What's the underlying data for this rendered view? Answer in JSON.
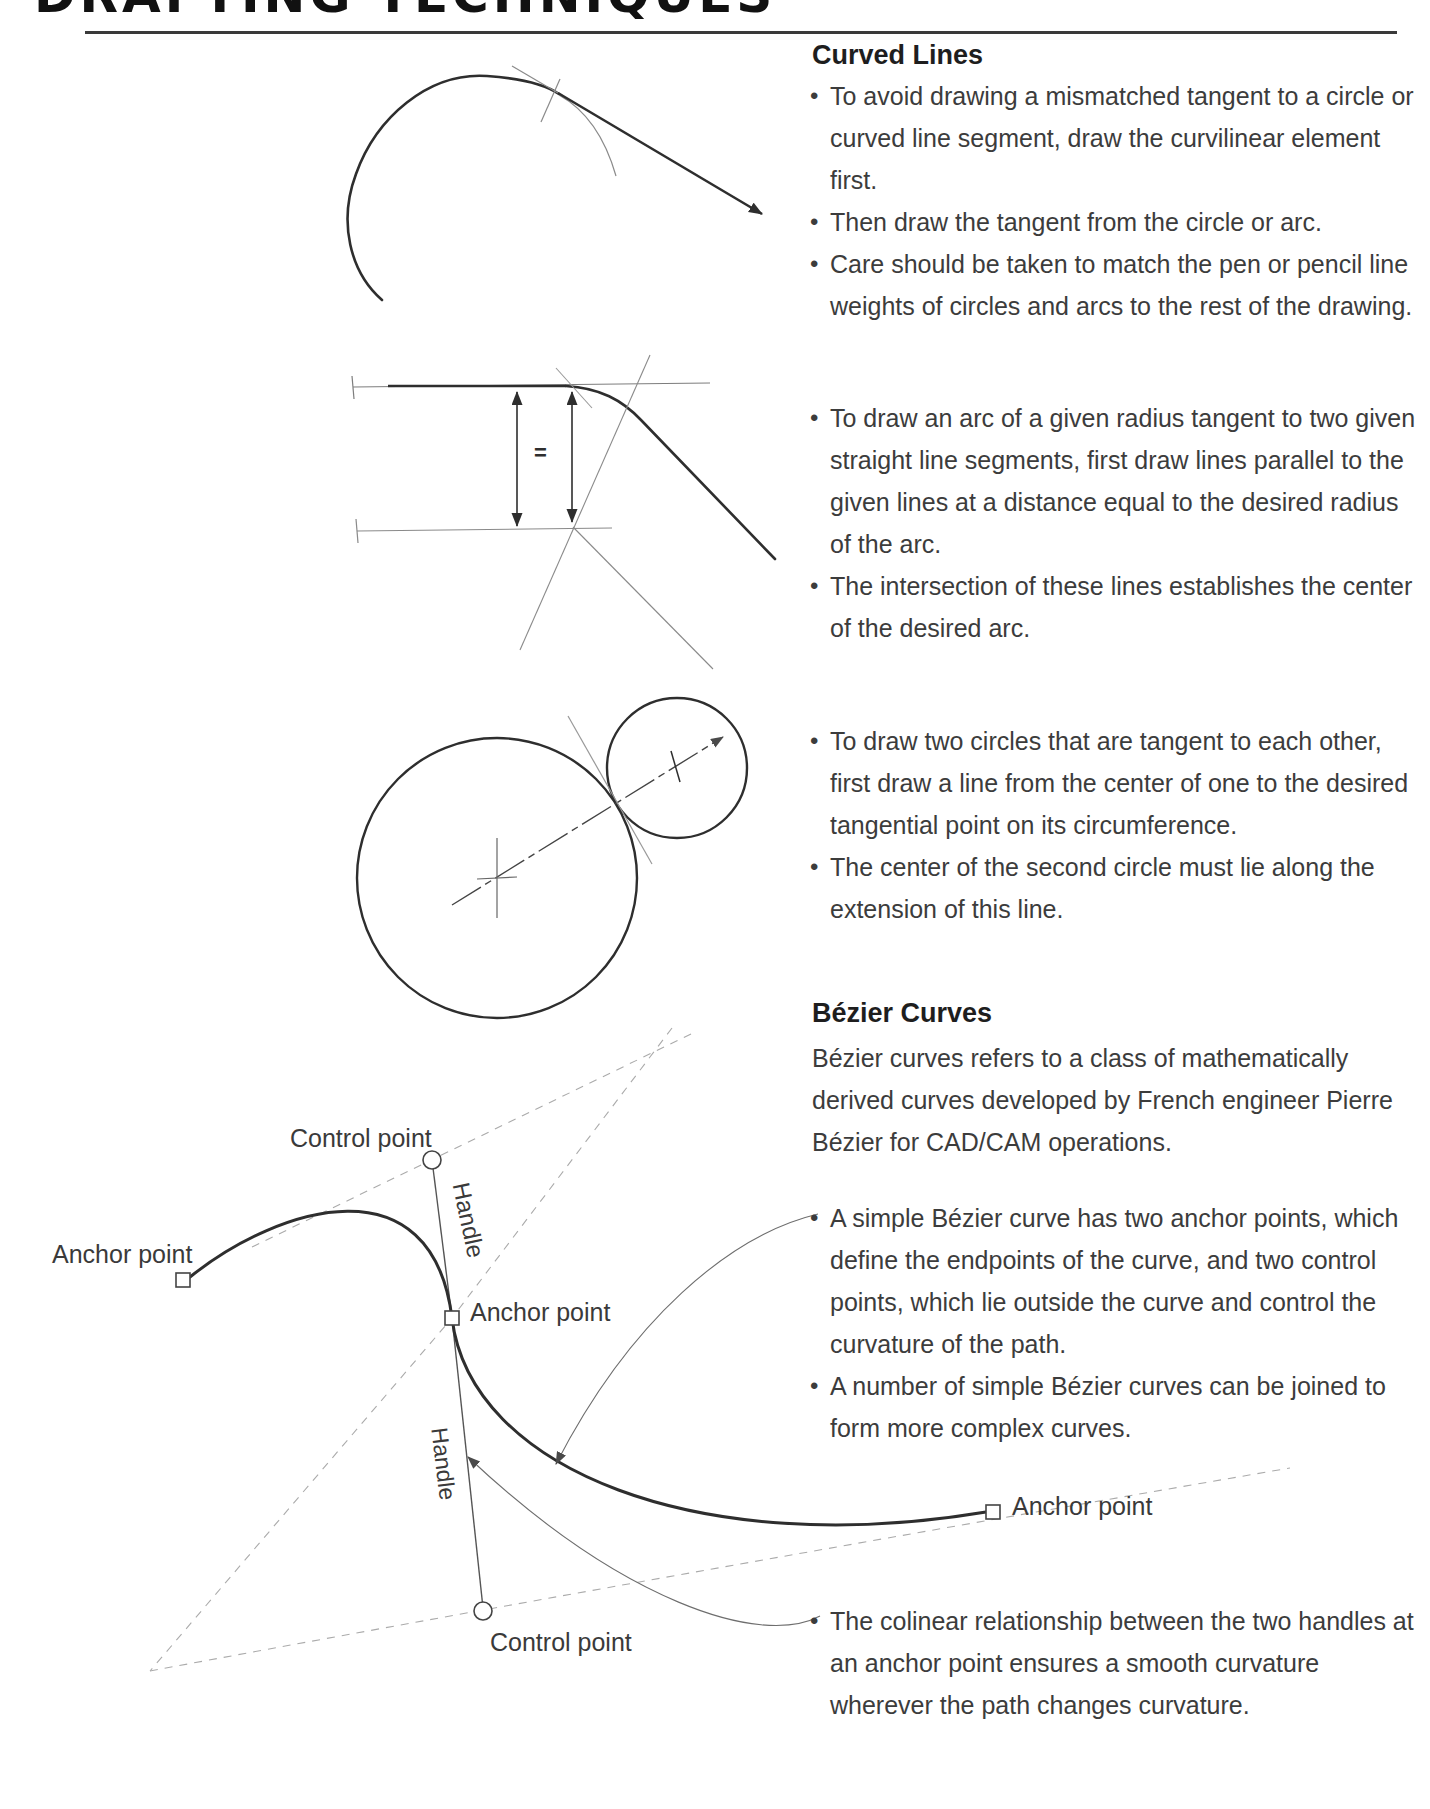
{
  "header": {
    "title": "DRAFTING TECHNIQUES"
  },
  "sections": {
    "curved_lines": {
      "heading": "Curved Lines",
      "bullets": [
        "To avoid drawing a mismatched tangent to a circle or curved line segment, draw the curvilinear element first.",
        "Then draw the tangent from the circle or arc.",
        "Care should be taken to match the pen or pencil line weights of circles and arcs to the rest of the drawing."
      ]
    },
    "arc_tangent": {
      "bullets": [
        "To draw an arc of a given radius tangent to two given straight line segments, first draw lines parallel to the given lines at a distance equal to the desired radius of the arc.",
        "The intersection of these lines establishes the center of the desired arc."
      ]
    },
    "tangent_circles": {
      "bullets": [
        "To draw two circles that are tangent to each other, first draw a line from the center of one to the desired tangential point on its circumference.",
        "The center of the second circle must lie along the extension of this line."
      ]
    },
    "bezier": {
      "heading": "Bézier Curves",
      "intro": "Bézier curves refers to a class of mathematically derived curves developed by French engineer Pierre Bézier for CAD/CAM operations.",
      "bullets": [
        "A simple Bézier curve has two anchor points, which define the endpoints of the curve, and two control points, which lie outside the curve and control the curvature of the path.",
        "A number of simple Bézier curves can be joined to form more complex curves."
      ],
      "note_bullets": [
        "The colinear relationship between the two handles at an anchor point ensures a smooth curvature wherever the path changes curvature."
      ]
    }
  },
  "diagram_labels": {
    "anchor_point": "Anchor point",
    "control_point": "Control point",
    "handle": "Handle",
    "equals": "="
  },
  "colors": {
    "ink_heavy": "#2e2e2e",
    "ink_text": "#3c3c3c",
    "construction": "#8a8a8a",
    "dashed": "#aaaaaa",
    "paper": "#ffffff"
  }
}
